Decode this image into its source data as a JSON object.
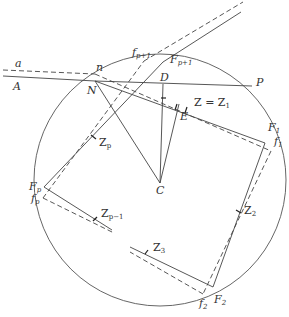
{
  "diagram": {
    "type": "geometric-construction",
    "circle": {
      "center_label": "C"
    },
    "points": {
      "a": "a",
      "A": "A",
      "n": "n",
      "N": "N",
      "D": "D",
      "P": "P",
      "E": "E",
      "C": "C",
      "Z_eq": "Z = Z",
      "Z_eq_sub": "1",
      "F1": "F",
      "F1_sub": "1",
      "f1": "f",
      "f1_sub": "1",
      "F2": "F",
      "F2_sub": "2",
      "f2": "f",
      "f2_sub": "2",
      "Z2": "Z",
      "Z2_sub": "2",
      "Z3": "Z",
      "Z3_sub": "3",
      "Zp": "Z",
      "Zp_sub": "p",
      "Zp1": "Z",
      "Zp1_sub": "p−1",
      "Fp": "F",
      "Fp_sub": "p",
      "fp": "f",
      "fp_sub": "p",
      "Fpp1": "F",
      "Fpp1_sub": "p+1",
      "fpp1": "f",
      "fpp1_sub": "p+1"
    },
    "line_styles": {
      "solid": "actual path",
      "dashed": "approximate path"
    },
    "colors": {
      "stroke": "#444444",
      "background": "#ffffff"
    }
  }
}
